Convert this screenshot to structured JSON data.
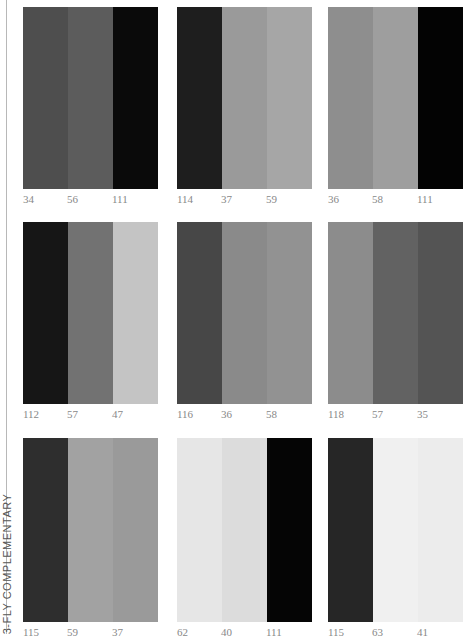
{
  "side_label": "3-FLY COMPLEMENTARY",
  "swatches": [
    {
      "stripes": [
        "#4e4e4e",
        "#5c5c5c",
        "#0a0a0a"
      ],
      "labels": [
        "34",
        "56",
        "111"
      ]
    },
    {
      "stripes": [
        "#1e1e1e",
        "#9a9a9a",
        "#a6a6a6"
      ],
      "labels": [
        "114",
        "37",
        "59"
      ]
    },
    {
      "stripes": [
        "#8e8e8e",
        "#9e9e9e",
        "#030303"
      ],
      "labels": [
        "36",
        "58",
        "111"
      ]
    },
    {
      "stripes": [
        "#161616",
        "#727272",
        "#c4c4c4"
      ],
      "labels": [
        "112",
        "57",
        "47"
      ]
    },
    {
      "stripes": [
        "#474747",
        "#8a8a8a",
        "#929292"
      ],
      "labels": [
        "116",
        "36",
        "58"
      ]
    },
    {
      "stripes": [
        "#8c8c8c",
        "#626262",
        "#545454"
      ],
      "labels": [
        "118",
        "57",
        "35"
      ]
    },
    {
      "stripes": [
        "#2e2e2e",
        "#a2a2a2",
        "#9a9a9a"
      ],
      "labels": [
        "115",
        "59",
        "37"
      ]
    },
    {
      "stripes": [
        "#e6e6e6",
        "#dcdcdc",
        "#050505"
      ],
      "labels": [
        "62",
        "40",
        "111"
      ]
    },
    {
      "stripes": [
        "#262626",
        "#f0f0f0",
        "#ececec"
      ],
      "labels": [
        "115",
        "63",
        "41"
      ]
    }
  ]
}
